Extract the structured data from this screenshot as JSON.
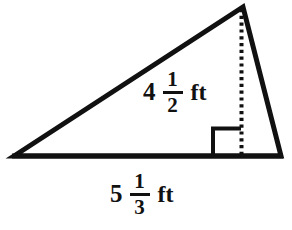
{
  "figure": {
    "name": "triangle-with-altitude",
    "shape": "triangle",
    "stroke_color": "#111111",
    "fill_color": "#ffffff",
    "background_color": "#ffffff"
  },
  "geometry": {
    "vertices": {
      "left": [
        14,
        156
      ],
      "apex": [
        243,
        7
      ],
      "right": [
        281,
        156
      ]
    },
    "altitude": {
      "from": [
        243,
        7
      ],
      "to": [
        241,
        156
      ],
      "style": "dotted"
    },
    "right_angle_marker": {
      "x": 213,
      "y": 127,
      "size": 28
    }
  },
  "labels": {
    "height": {
      "whole": "4",
      "numerator": "1",
      "denominator": "2",
      "unit": "ft",
      "full_text": "4 1/2 ft",
      "measures": "height"
    },
    "base": {
      "whole": "5",
      "numerator": "1",
      "denominator": "3",
      "unit": "ft",
      "full_text": "5 1/3 ft",
      "measures": "base"
    }
  }
}
